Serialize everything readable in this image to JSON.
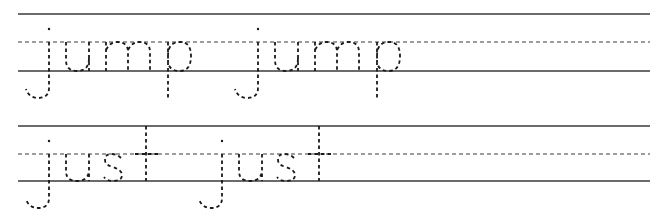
{
  "worksheet": {
    "rows": [
      {
        "word": "jump",
        "repetitions": 2
      },
      {
        "word": "just",
        "repetitions": 2
      }
    ],
    "style": {
      "line_color": "#3a3a3a",
      "trace_color": "#1a1a1a",
      "background": "#ffffff"
    }
  }
}
